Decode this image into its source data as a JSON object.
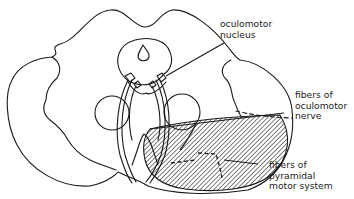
{
  "figure": {
    "type": "anatomical cross-section diagram (midbrain)",
    "stroke_color": "#1a1a1a",
    "background": "#ffffff"
  },
  "labels": {
    "oculomotor_nucleus": {
      "line1": "oculomotor",
      "line2": "nucleus"
    },
    "fibers_oculomotor_nerve": {
      "line1": "fibers of",
      "line2": "oculomotor",
      "line3": "nerve"
    },
    "fibers_pyramidal": {
      "line1": "fibers of",
      "line2": "pyramidal",
      "line3": "motor system"
    }
  }
}
